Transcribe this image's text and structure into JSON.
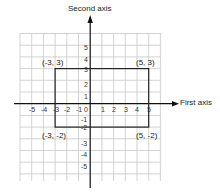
{
  "axes": {
    "x_label": "First axis",
    "y_label": "Second axis",
    "x_ticks": [
      "-5",
      "-4",
      "-3",
      "-2",
      "-1",
      "0",
      "1",
      "2",
      "3",
      "4",
      "5"
    ],
    "y_ticks_positive": [
      "1",
      "2",
      "3",
      "4",
      "5"
    ],
    "y_ticks_negative": [
      "-1",
      "-2",
      "-3",
      "-4",
      "-5"
    ]
  },
  "points": [
    {
      "label": "(-3, 3)"
    },
    {
      "label": "(5, 3)"
    },
    {
      "label": "(-3, -2)"
    },
    {
      "label": "(5, -2)"
    }
  ],
  "colors": {
    "grid": "#c8c8c8",
    "axis": "#111111",
    "rect": "#222222"
  }
}
